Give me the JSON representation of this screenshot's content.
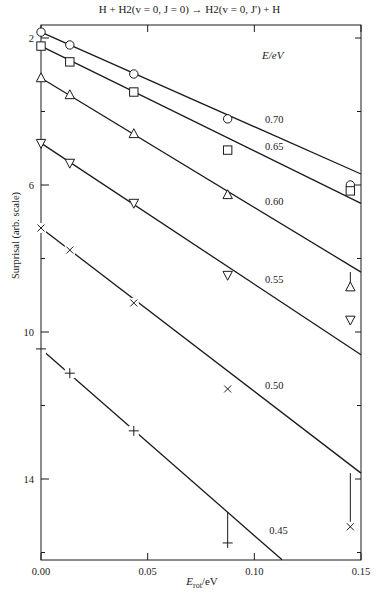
{
  "chart_data": {
    "type": "line",
    "title": "H + H2(v = 0, J = 0) → H2(v = 0, J') + H",
    "xlabel": "E_rot/eV",
    "ylabel": "Surprisal (arb. scale)",
    "legend_title": "E/eV",
    "xlim": [
      0.0,
      0.15
    ],
    "ylim": [
      1.0,
      16.2
    ],
    "y_inverted": true,
    "x_ticks": [
      0.0,
      0.05,
      0.1,
      0.15
    ],
    "x_tick_labels": [
      "0.00",
      "0.05",
      "0.10",
      "0.15"
    ],
    "y_ticks": [
      2,
      6,
      10,
      14
    ],
    "y_tick_labels": [
      "2",
      "6",
      "10",
      "14"
    ],
    "y_minor_ticks": [
      4,
      8,
      12,
      16
    ],
    "grid": false,
    "x": [
      0.0,
      0.0135,
      0.0435,
      0.0875,
      0.145
    ],
    "series": [
      {
        "name": "0.70",
        "marker": "circle",
        "values": [
          1.84,
          2.19,
          2.98,
          4.2,
          6.0
        ],
        "fit_line": [
          [
            0.0,
            1.84
          ],
          [
            0.15,
            5.7
          ]
        ],
        "label_pos": [
          0.105,
          4.3
        ]
      },
      {
        "name": "0.65",
        "marker": "square",
        "values": [
          2.22,
          2.65,
          3.47,
          5.05,
          6.16
        ],
        "fit_line": [
          [
            0.0,
            2.22
          ],
          [
            0.15,
            6.5
          ]
        ],
        "label_pos": [
          0.105,
          5.05
        ]
      },
      {
        "name": "0.60",
        "marker": "triangle-up",
        "values": [
          3.09,
          3.55,
          4.61,
          6.27,
          8.78
        ],
        "fit_line": [
          [
            0.0,
            3.09
          ],
          [
            0.15,
            8.37
          ]
        ],
        "label_pos": [
          0.105,
          6.55
        ]
      },
      {
        "name": "0.55",
        "marker": "triangle-down",
        "values": [
          4.86,
          5.4,
          6.49,
          8.45,
          9.67
        ],
        "fit_line": [
          [
            0.0,
            4.86
          ],
          [
            0.15,
            10.62
          ]
        ],
        "label_pos": [
          0.105,
          8.68
        ]
      },
      {
        "name": "0.50",
        "marker": "x",
        "values": [
          7.17,
          7.77,
          9.21,
          11.55,
          15.3
        ],
        "fit_line": [
          [
            0.0,
            7.17
          ],
          [
            0.15,
            13.84
          ]
        ],
        "label_pos": [
          0.105,
          11.55
        ]
      },
      {
        "name": "0.45",
        "marker": "plus",
        "values": [
          10.46,
          11.12,
          12.69,
          15.74,
          null
        ],
        "fit_line": [
          [
            0.0,
            10.46
          ],
          [
            0.113,
            16.2
          ]
        ],
        "label_pos": [
          0.107,
          15.5
        ]
      }
    ],
    "error_bars": [
      {
        "series": "0.70",
        "x": 0.145,
        "from": 5.9,
        "to": 6.0
      },
      {
        "series": "0.60",
        "x": 0.145,
        "from": 8.37,
        "to": 8.72
      },
      {
        "series": "0.50",
        "x": 0.145,
        "from": 13.84,
        "to": 15.2
      },
      {
        "series": "0.45",
        "x": 0.0875,
        "from": 14.9,
        "to": 15.65
      }
    ]
  }
}
